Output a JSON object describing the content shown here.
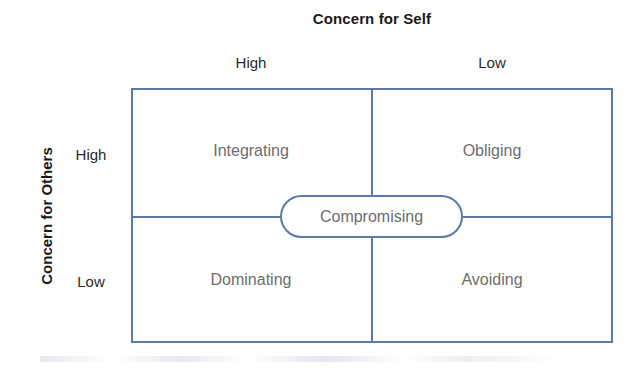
{
  "figure": {
    "title_top": "Concern for Self",
    "title_left": "Concern for Others",
    "column_headers": [
      "High",
      "Low"
    ],
    "row_headers": [
      "High",
      "Low"
    ],
    "quadrants": [
      {
        "key": "integrating",
        "label": "Integrating",
        "row": "High",
        "column": "High"
      },
      {
        "key": "obliging",
        "label": "Obliging",
        "row": "High",
        "column": "Low"
      },
      {
        "key": "dominating",
        "label": "Dominating",
        "row": "Low",
        "column": "High"
      },
      {
        "key": "avoiding",
        "label": "Avoiding",
        "row": "Low",
        "column": "Low"
      }
    ],
    "center": {
      "label": "Compromising"
    },
    "colors": {
      "line": "#5a7aa8",
      "heading_text": "#1a1a1a",
      "axis_tick_text": "#2a2a2a",
      "cell_text": "#6d6d6d",
      "background": "#ffffff"
    }
  },
  "chart_data": {
    "type": "table",
    "title": "Concern for Self",
    "xlabel": "Concern for Self",
    "ylabel": "Concern for Others",
    "columns": [
      "High",
      "Low"
    ],
    "rows": [
      "High",
      "Low"
    ],
    "cells": [
      [
        "Integrating",
        "Obliging"
      ],
      [
        "Dominating",
        "Avoiding"
      ]
    ],
    "overlay": [
      "Compromising"
    ],
    "grid": true,
    "legend": "none"
  }
}
